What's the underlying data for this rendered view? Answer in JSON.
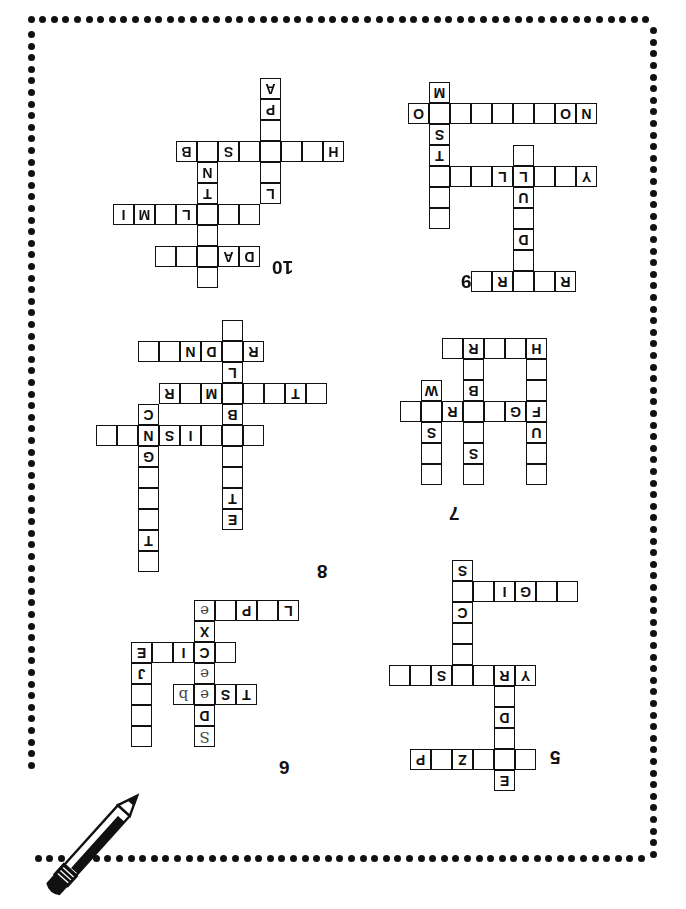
{
  "page": {
    "orientation": "rotated-180",
    "background_color": "#ffffff",
    "ink_color": "#111111",
    "border": {
      "style": "dotted",
      "dot_color": "#111111",
      "dot_size_px": 7,
      "spacing_px": 11.6
    },
    "decoration": {
      "pencil_label": "pencil-illustration"
    }
  },
  "puzzles": [
    {
      "number": "10",
      "num_pos": {
        "x": 272,
        "y": 258
      },
      "origin": {
        "x": 113,
        "y": 78
      },
      "cells": [
        {
          "c": 6,
          "r": 0,
          "t": ""
        },
        {
          "c": 4,
          "r": 1,
          "t": "D"
        },
        {
          "c": 5,
          "r": 1,
          "t": "A"
        },
        {
          "c": 6,
          "r": 1,
          "t": ""
        },
        {
          "c": 7,
          "r": 1,
          "t": ""
        },
        {
          "c": 8,
          "r": 1,
          "t": ""
        },
        {
          "c": 6,
          "r": 2,
          "t": ""
        },
        {
          "c": 4,
          "r": 3,
          "t": ""
        },
        {
          "c": 5,
          "r": 3,
          "t": ""
        },
        {
          "c": 6,
          "r": 3,
          "t": ""
        },
        {
          "c": 7,
          "r": 3,
          "t": "L"
        },
        {
          "c": 8,
          "r": 3,
          "t": ""
        },
        {
          "c": 9,
          "r": 3,
          "t": "M"
        },
        {
          "c": 10,
          "r": 3,
          "t": "I"
        },
        {
          "c": 3,
          "r": 4,
          "t": "L"
        },
        {
          "c": 6,
          "r": 4,
          "t": "T"
        },
        {
          "c": 3,
          "r": 5,
          "t": ""
        },
        {
          "c": 6,
          "r": 5,
          "t": "N"
        },
        {
          "c": 0,
          "r": 6,
          "t": "H"
        },
        {
          "c": 1,
          "r": 6,
          "t": ""
        },
        {
          "c": 2,
          "r": 6,
          "t": ""
        },
        {
          "c": 3,
          "r": 6,
          "t": ""
        },
        {
          "c": 4,
          "r": 6,
          "t": ""
        },
        {
          "c": 5,
          "r": 6,
          "t": "S"
        },
        {
          "c": 6,
          "r": 6,
          "t": ""
        },
        {
          "c": 7,
          "r": 6,
          "t": "B"
        },
        {
          "c": 3,
          "r": 7,
          "t": ""
        },
        {
          "c": 3,
          "r": 8,
          "t": "P"
        },
        {
          "c": 3,
          "r": 9,
          "t": "A"
        }
      ]
    },
    {
      "number": "9",
      "num_pos": {
        "x": 461,
        "y": 272
      },
      "origin": {
        "x": 408,
        "y": 82
      },
      "cells": [
        {
          "c": 0,
          "r": 0,
          "t": "R"
        },
        {
          "c": 1,
          "r": 0,
          "t": ""
        },
        {
          "c": 2,
          "r": 0,
          "t": ""
        },
        {
          "c": 3,
          "r": 0,
          "t": "R"
        },
        {
          "c": 4,
          "r": 0,
          "t": ""
        },
        {
          "c": 2,
          "r": 1,
          "t": ""
        },
        {
          "c": 2,
          "r": 2,
          "t": "D"
        },
        {
          "c": 2,
          "r": 3,
          "t": ""
        },
        {
          "c": 6,
          "r": 3,
          "t": ""
        },
        {
          "c": 2,
          "r": 4,
          "t": "U"
        },
        {
          "c": 6,
          "r": 4,
          "t": ""
        },
        {
          "c": -1,
          "r": 5,
          "t": "Y"
        },
        {
          "c": 0,
          "r": 5,
          "t": ""
        },
        {
          "c": 1,
          "r": 5,
          "t": ""
        },
        {
          "c": 2,
          "r": 5,
          "t": "L"
        },
        {
          "c": 3,
          "r": 5,
          "t": "L"
        },
        {
          "c": 4,
          "r": 5,
          "t": ""
        },
        {
          "c": 5,
          "r": 5,
          "t": ""
        },
        {
          "c": 6,
          "r": 5,
          "t": ""
        },
        {
          "c": 2,
          "r": 6,
          "t": ""
        },
        {
          "c": 6,
          "r": 6,
          "t": "T"
        },
        {
          "c": 6,
          "r": 7,
          "t": "S"
        },
        {
          "c": -1,
          "r": 8,
          "t": "N"
        },
        {
          "c": 0,
          "r": 8,
          "t": "O"
        },
        {
          "c": 1,
          "r": 8,
          "t": ""
        },
        {
          "c": 2,
          "r": 8,
          "t": ""
        },
        {
          "c": 3,
          "r": 8,
          "t": ""
        },
        {
          "c": 4,
          "r": 8,
          "t": ""
        },
        {
          "c": 5,
          "r": 8,
          "t": ""
        },
        {
          "c": 6,
          "r": 8,
          "t": ""
        },
        {
          "c": 7,
          "r": 8,
          "t": "O"
        },
        {
          "c": 6,
          "r": 9,
          "t": "M"
        }
      ]
    },
    {
      "number": "8",
      "num_pos": {
        "x": 317,
        "y": 562
      },
      "origin": {
        "x": 96,
        "y": 320
      },
      "cells": [
        {
          "c": 9,
          "r": 0,
          "t": ""
        },
        {
          "c": 9,
          "r": 1,
          "t": "T"
        },
        {
          "c": 5,
          "r": 2,
          "t": "E"
        },
        {
          "c": 9,
          "r": 2,
          "t": ""
        },
        {
          "c": 5,
          "r": 3,
          "t": "T"
        },
        {
          "c": 9,
          "r": 3,
          "t": ""
        },
        {
          "c": 5,
          "r": 4,
          "t": ""
        },
        {
          "c": 9,
          "r": 4,
          "t": ""
        },
        {
          "c": 5,
          "r": 5,
          "t": ""
        },
        {
          "c": 9,
          "r": 5,
          "t": "G"
        },
        {
          "c": 4,
          "r": 6,
          "t": ""
        },
        {
          "c": 5,
          "r": 6,
          "t": ""
        },
        {
          "c": 6,
          "r": 6,
          "t": ""
        },
        {
          "c": 7,
          "r": 6,
          "t": "I"
        },
        {
          "c": 8,
          "r": 6,
          "t": "S"
        },
        {
          "c": 9,
          "r": 6,
          "t": "N"
        },
        {
          "c": 10,
          "r": 6,
          "t": ""
        },
        {
          "c": 11,
          "r": 6,
          "t": ""
        },
        {
          "c": 5,
          "r": 7,
          "t": "B"
        },
        {
          "c": 9,
          "r": 7,
          "t": "C"
        },
        {
          "c": 1,
          "r": 8,
          "t": ""
        },
        {
          "c": 2,
          "r": 8,
          "t": "T"
        },
        {
          "c": 3,
          "r": 8,
          "t": ""
        },
        {
          "c": 4,
          "r": 8,
          "t": ""
        },
        {
          "c": 5,
          "r": 8,
          "t": ""
        },
        {
          "c": 6,
          "r": 8,
          "t": "M"
        },
        {
          "c": 7,
          "r": 8,
          "t": ""
        },
        {
          "c": 8,
          "r": 8,
          "t": "R"
        },
        {
          "c": 5,
          "r": 9,
          "t": "L"
        },
        {
          "c": 4,
          "r": 10,
          "t": "R"
        },
        {
          "c": 5,
          "r": 10,
          "t": ""
        },
        {
          "c": 6,
          "r": 10,
          "t": "D"
        },
        {
          "c": 7,
          "r": 10,
          "t": "N"
        },
        {
          "c": 8,
          "r": 10,
          "t": ""
        },
        {
          "c": 9,
          "r": 10,
          "t": ""
        },
        {
          "c": 5,
          "r": 11,
          "t": ""
        }
      ]
    },
    {
      "number": "7",
      "num_pos": {
        "x": 449,
        "y": 504
      },
      "origin": {
        "x": 400,
        "y": 338
      },
      "cells": [
        {
          "c": 0,
          "r": 0,
          "t": ""
        },
        {
          "c": 3,
          "r": 0,
          "t": ""
        },
        {
          "c": 5,
          "r": 0,
          "t": ""
        },
        {
          "c": 0,
          "r": 1,
          "t": ""
        },
        {
          "c": 3,
          "r": 1,
          "t": "S"
        },
        {
          "c": 5,
          "r": 1,
          "t": ""
        },
        {
          "c": 0,
          "r": 2,
          "t": "U"
        },
        {
          "c": 3,
          "r": 2,
          "t": ""
        },
        {
          "c": 5,
          "r": 2,
          "t": "S"
        },
        {
          "c": 0,
          "r": 3,
          "t": "F"
        },
        {
          "c": 1,
          "r": 3,
          "t": "G"
        },
        {
          "c": 2,
          "r": 3,
          "t": ""
        },
        {
          "c": 3,
          "r": 3,
          "t": ""
        },
        {
          "c": 4,
          "r": 3,
          "t": "R"
        },
        {
          "c": 5,
          "r": 3,
          "t": ""
        },
        {
          "c": 6,
          "r": 3,
          "t": ""
        },
        {
          "c": 0,
          "r": 4,
          "t": ""
        },
        {
          "c": 3,
          "r": 4,
          "t": "B"
        },
        {
          "c": 5,
          "r": 4,
          "t": "W"
        },
        {
          "c": 0,
          "r": 5,
          "t": ""
        },
        {
          "c": 3,
          "r": 5,
          "t": ""
        },
        {
          "c": 0,
          "r": 6,
          "t": "H"
        },
        {
          "c": 1,
          "r": 6,
          "t": ""
        },
        {
          "c": 2,
          "r": 6,
          "t": ""
        },
        {
          "c": 3,
          "r": 6,
          "t": "R"
        },
        {
          "c": 4,
          "r": 6,
          "t": ""
        }
      ]
    },
    {
      "number": "6",
      "num_pos": {
        "x": 279,
        "y": 758
      },
      "origin": {
        "x": 131,
        "y": 600
      },
      "cells": [
        {
          "c": 4,
          "r": 0,
          "t": "S",
          "hand": true
        },
        {
          "c": 7,
          "r": 0,
          "t": ""
        },
        {
          "c": 4,
          "r": 1,
          "t": "D"
        },
        {
          "c": 7,
          "r": 1,
          "t": ""
        },
        {
          "c": 2,
          "r": 2,
          "t": "T"
        },
        {
          "c": 3,
          "r": 2,
          "t": "S"
        },
        {
          "c": 4,
          "r": 2,
          "t": "e",
          "hand": true
        },
        {
          "c": 5,
          "r": 2,
          "t": "b",
          "hand": true
        },
        {
          "c": 7,
          "r": 2,
          "t": ""
        },
        {
          "c": 4,
          "r": 3,
          "t": "e",
          "hand": true
        },
        {
          "c": 7,
          "r": 3,
          "t": "J"
        },
        {
          "c": 3,
          "r": 4,
          "t": ""
        },
        {
          "c": 4,
          "r": 4,
          "t": "C"
        },
        {
          "c": 5,
          "r": 4,
          "t": "I"
        },
        {
          "c": 6,
          "r": 4,
          "t": ""
        },
        {
          "c": 7,
          "r": 4,
          "t": "E"
        },
        {
          "c": 4,
          "r": 5,
          "t": "X"
        },
        {
          "c": 0,
          "r": 6,
          "t": "L"
        },
        {
          "c": 1,
          "r": 6,
          "t": ""
        },
        {
          "c": 2,
          "r": 6,
          "t": "P"
        },
        {
          "c": 3,
          "r": 6,
          "t": ""
        },
        {
          "c": 4,
          "r": 6,
          "t": "e",
          "hand": true
        }
      ]
    },
    {
      "number": "5",
      "num_pos": {
        "x": 550,
        "y": 748
      },
      "origin": {
        "x": 389,
        "y": 560
      },
      "cells": [
        {
          "c": 3,
          "r": 0,
          "t": "E"
        },
        {
          "c": 2,
          "r": 1,
          "t": ""
        },
        {
          "c": 3,
          "r": 1,
          "t": ""
        },
        {
          "c": 4,
          "r": 1,
          "t": ""
        },
        {
          "c": 5,
          "r": 1,
          "t": "Z"
        },
        {
          "c": 6,
          "r": 1,
          "t": ""
        },
        {
          "c": 7,
          "r": 1,
          "t": "P"
        },
        {
          "c": 3,
          "r": 2,
          "t": ""
        },
        {
          "c": 3,
          "r": 3,
          "t": "D"
        },
        {
          "c": 3,
          "r": 4,
          "t": ""
        },
        {
          "c": 2,
          "r": 5,
          "t": "Y"
        },
        {
          "c": 3,
          "r": 5,
          "t": "R"
        },
        {
          "c": 4,
          "r": 5,
          "t": ""
        },
        {
          "c": 5,
          "r": 5,
          "t": ""
        },
        {
          "c": 6,
          "r": 5,
          "t": "S"
        },
        {
          "c": 7,
          "r": 5,
          "t": ""
        },
        {
          "c": 8,
          "r": 5,
          "t": ""
        },
        {
          "c": 5,
          "r": 6,
          "t": ""
        },
        {
          "c": 5,
          "r": 7,
          "t": ""
        },
        {
          "c": 5,
          "r": 8,
          "t": "C"
        },
        {
          "c": 0,
          "r": 9,
          "t": ""
        },
        {
          "c": 1,
          "r": 9,
          "t": ""
        },
        {
          "c": 2,
          "r": 9,
          "t": "G"
        },
        {
          "c": 3,
          "r": 9,
          "t": "I"
        },
        {
          "c": 4,
          "r": 9,
          "t": ""
        },
        {
          "c": 5,
          "r": 9,
          "t": ""
        },
        {
          "c": 5,
          "r": 10,
          "t": "S"
        }
      ]
    }
  ]
}
